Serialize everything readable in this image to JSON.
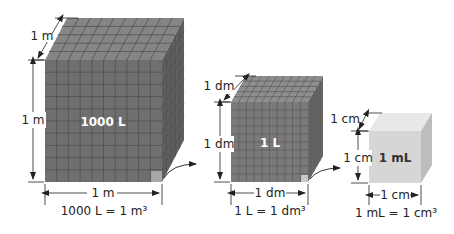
{
  "diagram": {
    "cubes": [
      {
        "id": "large",
        "inner_label": "1000 L",
        "depth_label": "1 m",
        "height_label": "1 m",
        "width_label": "1 m",
        "caption": "1000 L = 1 m³",
        "colors": {
          "front": "#6f6f6f",
          "top": "#858585",
          "side": "#5e5e5e",
          "grid": "#525252",
          "highlight": "#a8a8a8"
        }
      },
      {
        "id": "medium",
        "inner_label": "1 L",
        "depth_label": "1 dm",
        "height_label": "1 dm",
        "width_label": "1 dm",
        "caption": "1 L = 1 dm³",
        "colors": {
          "front": "#7a7a7a",
          "top": "#8e8e8e",
          "side": "#666666",
          "grid": "#5a5a5a",
          "highlight": "#c8c8c8"
        }
      },
      {
        "id": "small",
        "inner_label": "1 mL",
        "depth_label": "1 cm",
        "height_label": "1 cm",
        "width_label": "1 cm",
        "caption": "1 mL = 1 cm³",
        "colors": {
          "front": "#d6d6d6",
          "top": "#e8e8e8",
          "side": "#bdbdbd"
        }
      }
    ],
    "connectors": [
      "zoom-arrow-large-to-medium",
      "zoom-arrow-medium-to-small"
    ]
  }
}
